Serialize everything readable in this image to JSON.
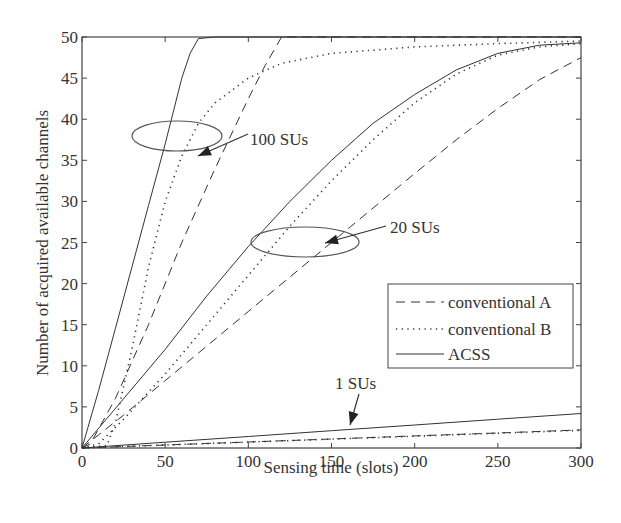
{
  "chart_data": {
    "type": "line",
    "title": "",
    "xlabel": "Sensing time (slots)",
    "ylabel": "Number of acquired available channels",
    "xlim": [
      0,
      300
    ],
    "ylim": [
      0,
      50
    ],
    "xticks": [
      0,
      50,
      100,
      150,
      200,
      250,
      300
    ],
    "yticks": [
      0,
      5,
      10,
      15,
      20,
      25,
      30,
      35,
      40,
      45,
      50
    ],
    "grid": false,
    "legend": {
      "position": "lower-right-inside",
      "entries": [
        {
          "label": "conventional A",
          "style": "dashed"
        },
        {
          "label": "conventional B",
          "style": "dotted"
        },
        {
          "label": "ACSS",
          "style": "solid"
        }
      ]
    },
    "annotations": [
      {
        "text": "100 SUs",
        "target": "100-SU curve group",
        "ellipse_center": [
          57,
          35
        ]
      },
      {
        "text": "20 SUs",
        "target": "20-SU curve group",
        "ellipse_center": [
          145,
          25
        ]
      },
      {
        "text": "1 SUs",
        "target": "1-SU curve group",
        "arrow_to": [
          162,
          1.6
        ]
      }
    ],
    "series": [
      {
        "name": "ACSS (100 SUs)",
        "style": "solid",
        "x": [
          0,
          10,
          20,
          30,
          40,
          50,
          55,
          60,
          65,
          70,
          80,
          100,
          150,
          200,
          250,
          300
        ],
        "y": [
          0,
          7,
          14.5,
          22,
          29.5,
          37,
          41,
          45,
          48,
          49.8,
          50,
          50,
          50,
          50,
          50,
          50
        ]
      },
      {
        "name": "conventional A (100 SUs)",
        "style": "dashed",
        "x": [
          0,
          5,
          20,
          40,
          60,
          80,
          100,
          110,
          120,
          150,
          200,
          250,
          300
        ],
        "y": [
          0,
          0.5,
          6,
          15,
          25,
          34,
          42.5,
          46.5,
          50,
          50,
          50,
          50,
          50
        ]
      },
      {
        "name": "conventional B (100 SUs)",
        "style": "dotted",
        "x": [
          0,
          15,
          20,
          30,
          40,
          50,
          60,
          70,
          80,
          100,
          120,
          150,
          200,
          250,
          300
        ],
        "y": [
          0,
          0.3,
          3,
          12,
          22,
          30,
          35.5,
          39.5,
          42,
          45,
          46.8,
          48,
          48.8,
          49.2,
          49.5
        ]
      },
      {
        "name": "ACSS (20 SUs)",
        "style": "solid",
        "x": [
          0,
          25,
          50,
          75,
          100,
          125,
          150,
          175,
          200,
          225,
          250,
          275,
          300
        ],
        "y": [
          0,
          6,
          12,
          18.5,
          24.5,
          30,
          35,
          39.5,
          43,
          46,
          48,
          49,
          49.3
        ]
      },
      {
        "name": "conventional A (20 SUs)",
        "style": "dashed",
        "x": [
          0,
          25,
          50,
          75,
          100,
          125,
          150,
          175,
          200,
          225,
          250,
          275,
          300
        ],
        "y": [
          0,
          4,
          8.2,
          12.4,
          16.6,
          20.8,
          25,
          29.2,
          33.4,
          37.5,
          41.3,
          44.8,
          47.5
        ]
      },
      {
        "name": "conventional B (20 SUs)",
        "style": "dotted",
        "x": [
          0,
          10,
          25,
          50,
          75,
          100,
          125,
          150,
          175,
          200,
          225,
          250,
          275,
          300
        ],
        "y": [
          0,
          0.5,
          3.5,
          9,
          15,
          21,
          27,
          32.5,
          37.5,
          42,
          45.5,
          47.8,
          48.8,
          49.2
        ]
      },
      {
        "name": "ACSS (1 SUs)",
        "style": "solid",
        "x": [
          0,
          50,
          100,
          150,
          200,
          250,
          300
        ],
        "y": [
          0,
          0.7,
          1.4,
          2.1,
          2.8,
          3.5,
          4.2
        ]
      },
      {
        "name": "conventional A (1 SUs)",
        "style": "dashed",
        "x": [
          0,
          50,
          100,
          150,
          200,
          250,
          300
        ],
        "y": [
          0,
          0.37,
          0.73,
          1.1,
          1.47,
          1.83,
          2.2
        ]
      },
      {
        "name": "conventional B (1 SUs)",
        "style": "dotted",
        "x": [
          0,
          50,
          100,
          150,
          200,
          250,
          300
        ],
        "y": [
          0,
          0.36,
          0.72,
          1.08,
          1.44,
          1.8,
          2.15
        ]
      }
    ]
  },
  "labels": {
    "xlabel": "Sensing time (slots)",
    "ylabel": "Number of acquired available channels",
    "annot_100": "100 SUs",
    "annot_20": "20 SUs",
    "annot_1": "1 SUs",
    "legend_a": "conventional A",
    "legend_b": "conventional B",
    "legend_acss": "ACSS"
  },
  "colors": {
    "line": "#333333",
    "axis": "#444444",
    "background": "#ffffff"
  }
}
